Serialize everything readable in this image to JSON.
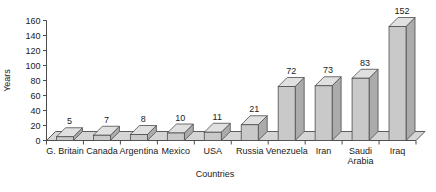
{
  "chart_data": {
    "type": "bar",
    "title": "",
    "subtitle": "",
    "xlabel": "Countries",
    "ylabel": "Years",
    "categories": [
      "G. Britain",
      "Canada",
      "Argentina",
      "Mexico",
      "USA",
      "Russia",
      "Venezuela",
      "Iran",
      "Saudi Arabia",
      "Iraq"
    ],
    "values": [
      5,
      7,
      8,
      10,
      11,
      21,
      72,
      73,
      83,
      152
    ],
    "value_labels": [
      "5",
      "7",
      "8",
      "10",
      "11",
      "21",
      "72",
      "73",
      "83",
      "152"
    ],
    "ylim": [
      0,
      160
    ],
    "ytick_labels": [
      "0",
      "20",
      "40",
      "60",
      "80",
      "100",
      "120",
      "140",
      "160"
    ],
    "ytick_values": [
      0,
      20,
      40,
      60,
      80,
      100,
      120,
      140,
      160
    ],
    "grid": false,
    "legend": false,
    "legend_position": "none",
    "style": "3d-bar",
    "colors": {
      "bar_front": "#c9c9c9",
      "bar_side": "#ababab",
      "bar_top": "#e0e0e0",
      "bar_outline": "#4d4d4d",
      "floor": "#d5d5d5",
      "axis": "#4d4d4d",
      "text": "#1a1a1a",
      "background": "#ffffff"
    }
  },
  "axes": {
    "y_title": "Years",
    "x_title": "Countries"
  },
  "category_lines": [
    [
      "G. Britain"
    ],
    [
      "Canada"
    ],
    [
      "Argentina"
    ],
    [
      "Mexico"
    ],
    [
      "USA"
    ],
    [
      "Russia"
    ],
    [
      "Venezuela"
    ],
    [
      "Iran"
    ],
    [
      "Saudi",
      "Arabia"
    ],
    [
      "Iraq"
    ]
  ]
}
